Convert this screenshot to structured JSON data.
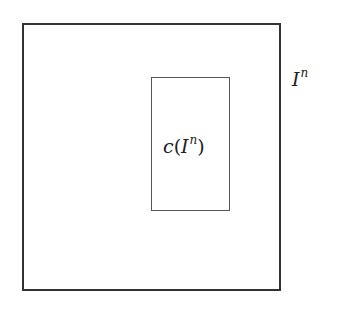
{
  "diagram": {
    "outer": {
      "label_base": "I",
      "label_exp": "n",
      "stroke": "#333333"
    },
    "inner": {
      "label_func": "c",
      "label_open": "(",
      "label_base": "I",
      "label_exp": "n",
      "label_close": ")",
      "stroke": "#555555"
    }
  }
}
